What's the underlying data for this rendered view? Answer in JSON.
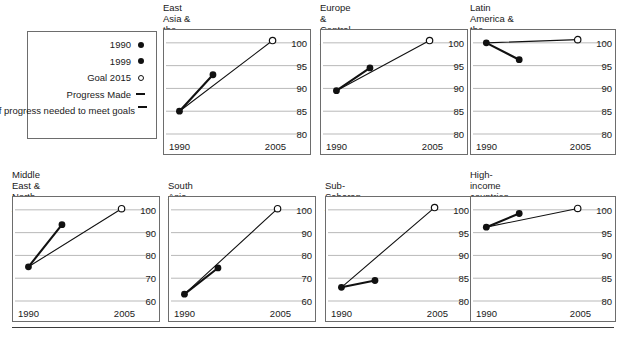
{
  "legend": {
    "title": "legend",
    "items": [
      {
        "label": "1990",
        "marker": "filled-circle-icon"
      },
      {
        "label": "1999",
        "marker": "filled-circle-icon"
      },
      {
        "label": "Goal 2015",
        "marker": "open-circle-icon"
      },
      {
        "label": "Progress Made",
        "marker": "dash-icon"
      },
      {
        "label": "Rate of progress\nneeded to meet goals",
        "marker": "dash-icon"
      }
    ]
  },
  "axis": {
    "x_start_label": "1990",
    "x_end_label": "2005"
  },
  "colors": {
    "ink": "#111111",
    "frame": "#6d6d6d",
    "gridline": "#b9b9b9",
    "background": "#ffffff"
  },
  "chart_data": [
    {
      "type": "line",
      "title": "East Asia &\nthe Pacific",
      "xlabel": "",
      "ylabel": "",
      "x": [
        1990,
        1999,
        2015
      ],
      "xlim": [
        1988,
        2017
      ],
      "ylim": [
        80,
        101.5
      ],
      "yticks": [
        80,
        85,
        90,
        95,
        100
      ],
      "ytick_labels": [
        "80",
        "85",
        "90",
        "95",
        "100"
      ],
      "xtick_labels": [
        "1990",
        "2005"
      ],
      "grid": true,
      "legend": "none",
      "series": [
        {
          "name": "Progress Made",
          "style": "thick",
          "points": [
            [
              1990,
              85.0
            ],
            [
              1999,
              93.0
            ]
          ]
        },
        {
          "name": "Rate of progress needed to meet goals",
          "style": "thin",
          "points": [
            [
              1990,
              85.0
            ],
            [
              2015,
              100.5
            ]
          ]
        }
      ],
      "markers": [
        {
          "name": "1990",
          "x": 1990,
          "y": 85.0,
          "fill": "solid"
        },
        {
          "name": "1999",
          "x": 1999,
          "y": 93.0,
          "fill": "solid"
        },
        {
          "name": "Goal 2015",
          "x": 2015,
          "y": 100.5,
          "fill": "open"
        }
      ]
    },
    {
      "type": "line",
      "title": "Europe &\nCentral Asia",
      "xlabel": "",
      "ylabel": "",
      "x": [
        1990,
        1999,
        2015
      ],
      "xlim": [
        1988,
        2017
      ],
      "ylim": [
        80,
        101.5
      ],
      "yticks": [
        80,
        85,
        90,
        95,
        100
      ],
      "ytick_labels": [
        "80",
        "85",
        "90",
        "95",
        "100"
      ],
      "xtick_labels": [
        "1990",
        "2005"
      ],
      "grid": true,
      "legend": "none",
      "series": [
        {
          "name": "Progress Made",
          "style": "thick",
          "points": [
            [
              1990,
              89.5
            ],
            [
              1999,
              94.5
            ]
          ]
        },
        {
          "name": "Rate of progress needed to meet goals",
          "style": "thin",
          "points": [
            [
              1990,
              89.5
            ],
            [
              2015,
              100.5
            ]
          ]
        }
      ],
      "markers": [
        {
          "name": "1990",
          "x": 1990,
          "y": 89.5,
          "fill": "solid"
        },
        {
          "name": "1999",
          "x": 1999,
          "y": 94.5,
          "fill": "solid"
        },
        {
          "name": "Goal 2015",
          "x": 2015,
          "y": 100.5,
          "fill": "open"
        }
      ]
    },
    {
      "type": "line",
      "title": "Latin America &\nthe Caribbean",
      "xlabel": "",
      "ylabel": "",
      "x": [
        1990,
        1999,
        2015
      ],
      "xlim": [
        1988,
        2017
      ],
      "ylim": [
        80,
        101.5
      ],
      "yticks": [
        80,
        85,
        90,
        95,
        100
      ],
      "ytick_labels": [
        "80",
        "85",
        "90",
        "95",
        "100"
      ],
      "xtick_labels": [
        "1990",
        "2005"
      ],
      "grid": true,
      "legend": "none",
      "series": [
        {
          "name": "Progress Made",
          "style": "thick",
          "points": [
            [
              1990,
              100.0
            ],
            [
              1999,
              96.3
            ]
          ]
        },
        {
          "name": "Rate of progress needed to meet goals",
          "style": "thin",
          "points": [
            [
              1990,
              100.0
            ],
            [
              2015,
              100.7
            ]
          ]
        }
      ],
      "markers": [
        {
          "name": "1990",
          "x": 1990,
          "y": 100.0,
          "fill": "solid"
        },
        {
          "name": "1999",
          "x": 1999,
          "y": 96.3,
          "fill": "solid"
        },
        {
          "name": "Goal 2015",
          "x": 2015,
          "y": 100.7,
          "fill": "open"
        }
      ]
    },
    {
      "type": "line",
      "title": "Middle East &\nNorth Africa",
      "xlabel": "",
      "ylabel": "",
      "x": [
        1990,
        1999,
        2015
      ],
      "xlim": [
        1988,
        2017
      ],
      "ylim": [
        60,
        103
      ],
      "yticks": [
        60,
        70,
        80,
        90,
        100
      ],
      "ytick_labels": [
        "60",
        "70",
        "80",
        "90",
        "100"
      ],
      "xtick_labels": [
        "1990",
        "2005"
      ],
      "grid": true,
      "legend": "none",
      "series": [
        {
          "name": "Progress Made",
          "style": "thick",
          "points": [
            [
              1990,
              75.0
            ],
            [
              1999,
              93.5
            ]
          ]
        },
        {
          "name": "Rate of progress needed to meet goals",
          "style": "thin",
          "points": [
            [
              1990,
              75.0
            ],
            [
              2015,
              100.5
            ]
          ]
        }
      ],
      "markers": [
        {
          "name": "1990",
          "x": 1990,
          "y": 75.0,
          "fill": "solid"
        },
        {
          "name": "1999",
          "x": 1999,
          "y": 93.5,
          "fill": "solid"
        },
        {
          "name": "Goal 2015",
          "x": 2015,
          "y": 100.5,
          "fill": "open"
        }
      ]
    },
    {
      "type": "line",
      "title": "South Asia",
      "xlabel": "",
      "ylabel": "",
      "x": [
        1990,
        1999,
        2015
      ],
      "xlim": [
        1988,
        2017
      ],
      "ylim": [
        60,
        103
      ],
      "yticks": [
        60,
        70,
        80,
        90,
        100
      ],
      "ytick_labels": [
        "60",
        "70",
        "80",
        "90",
        "100"
      ],
      "xtick_labels": [
        "1990",
        "2005"
      ],
      "grid": true,
      "legend": "none",
      "series": [
        {
          "name": "Progress Made",
          "style": "thick",
          "points": [
            [
              1990,
              63.0
            ],
            [
              1999,
              74.5
            ]
          ]
        },
        {
          "name": "Rate of progress needed to meet goals",
          "style": "thin",
          "points": [
            [
              1990,
              63.0
            ],
            [
              2015,
              100.5
            ]
          ]
        }
      ],
      "markers": [
        {
          "name": "1990",
          "x": 1990,
          "y": 63.0,
          "fill": "solid"
        },
        {
          "name": "1999",
          "x": 1999,
          "y": 74.5,
          "fill": "solid"
        },
        {
          "name": "Goal 2015",
          "x": 2015,
          "y": 100.5,
          "fill": "open"
        }
      ]
    },
    {
      "type": "line",
      "title": "Sub-Saharan Africa",
      "xlabel": "",
      "ylabel": "",
      "x": [
        1990,
        1999,
        2015
      ],
      "xlim": [
        1988,
        2017
      ],
      "ylim": [
        80,
        101.5
      ],
      "yticks": [
        80,
        85,
        90,
        95,
        100
      ],
      "ytick_labels": [
        "80",
        "85",
        "90",
        "95",
        "100"
      ],
      "xtick_labels": [
        "1990",
        "2005"
      ],
      "grid": true,
      "legend": "none",
      "series": [
        {
          "name": "Progress Made",
          "style": "thick",
          "points": [
            [
              1990,
              83.0
            ],
            [
              1999,
              84.5
            ]
          ]
        },
        {
          "name": "Rate of progress needed to meet goals",
          "style": "thin",
          "points": [
            [
              1990,
              83.0
            ],
            [
              2015,
              100.5
            ]
          ]
        }
      ],
      "markers": [
        {
          "name": "1990",
          "x": 1990,
          "y": 83.0,
          "fill": "solid"
        },
        {
          "name": "1999",
          "x": 1999,
          "y": 84.5,
          "fill": "solid"
        },
        {
          "name": "Goal 2015",
          "x": 2015,
          "y": 100.5,
          "fill": "open"
        }
      ]
    },
    {
      "type": "line",
      "title": "High-income\ncountries",
      "xlabel": "",
      "ylabel": "",
      "x": [
        1990,
        1999,
        2015
      ],
      "xlim": [
        1988,
        2017
      ],
      "ylim": [
        80,
        101.5
      ],
      "yticks": [
        80,
        85,
        90,
        95,
        100
      ],
      "ytick_labels": [
        "80",
        "85",
        "90",
        "95",
        "100"
      ],
      "xtick_labels": [
        "1990",
        "2005"
      ],
      "grid": true,
      "legend": "none",
      "series": [
        {
          "name": "Progress Made",
          "style": "thick",
          "points": [
            [
              1990,
              96.2
            ],
            [
              1999,
              99.2
            ]
          ]
        },
        {
          "name": "Rate of progress needed to meet goals",
          "style": "thin",
          "points": [
            [
              1990,
              96.2
            ],
            [
              2015,
              100.3
            ]
          ]
        }
      ],
      "markers": [
        {
          "name": "1990",
          "x": 1990,
          "y": 96.2,
          "fill": "solid"
        },
        {
          "name": "1999",
          "x": 1999,
          "y": 99.2,
          "fill": "solid"
        },
        {
          "name": "Goal 2015",
          "x": 2015,
          "y": 100.3,
          "fill": "open"
        }
      ]
    }
  ],
  "layout": {
    "panels": [
      {
        "left": 163,
        "title_top": 2,
        "plot_top": 29,
        "w": 148,
        "h": 126,
        "title_lines": 2
      },
      {
        "left": 320,
        "title_top": 2,
        "plot_top": 29,
        "w": 148,
        "h": 126,
        "title_lines": 2
      },
      {
        "left": 470,
        "title_top": 2,
        "plot_top": 29,
        "w": 146,
        "h": 126,
        "title_lines": 2
      },
      {
        "left": 12,
        "title_top": 169,
        "plot_top": 196,
        "w": 148,
        "h": 126,
        "title_lines": 2
      },
      {
        "left": 168,
        "title_top": 180,
        "plot_top": 196,
        "w": 148,
        "h": 126,
        "title_lines": 1
      },
      {
        "left": 325,
        "title_top": 180,
        "plot_top": 196,
        "w": 148,
        "h": 126,
        "title_lines": 1
      },
      {
        "left": 470,
        "title_top": 169,
        "plot_top": 196,
        "w": 146,
        "h": 126,
        "title_lines": 2
      }
    ]
  }
}
